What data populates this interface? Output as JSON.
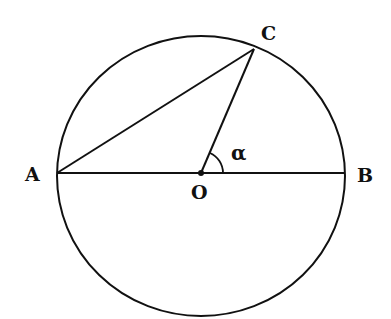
{
  "diagram": {
    "type": "circle-geometry",
    "labels": {
      "A": "A",
      "B": "B",
      "C": "C",
      "O": "O",
      "angle": "α"
    },
    "colors": {
      "stroke": "#111111",
      "background": "#ffffff"
    },
    "elements": [
      {
        "kind": "circle",
        "center": "O"
      },
      {
        "kind": "segment",
        "from": "A",
        "to": "B",
        "role": "diameter"
      },
      {
        "kind": "segment",
        "from": "A",
        "to": "C",
        "role": "chord"
      },
      {
        "kind": "segment",
        "from": "O",
        "to": "C",
        "role": "radius"
      },
      {
        "kind": "angle-arc",
        "vertex": "O",
        "between": [
          "B",
          "C"
        ],
        "label": "α"
      },
      {
        "kind": "point",
        "name": "O",
        "dot": true
      }
    ]
  }
}
